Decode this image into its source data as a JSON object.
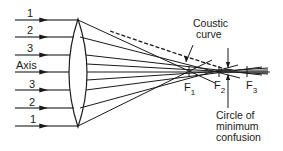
{
  "figure": {
    "colors": {
      "ink": "#1a1a1a",
      "background": "#ffffff"
    }
  },
  "rays": [
    {
      "label": "1",
      "y": 20
    },
    {
      "label": "2",
      "y": 37
    },
    {
      "label": "3",
      "y": 55
    },
    {
      "label": "Axis",
      "y": 71
    },
    {
      "label": "3",
      "y": 90
    },
    {
      "label": "2",
      "y": 108
    },
    {
      "label": "1",
      "y": 126
    }
  ],
  "foci": [
    {
      "label": "F",
      "sub": "1",
      "x": 189
    },
    {
      "label": "F",
      "sub": "2",
      "x": 219
    },
    {
      "label": "F",
      "sub": "3",
      "x": 247
    }
  ],
  "annotations": {
    "caustic_line1": "Coustic",
    "caustic_line2": "curve",
    "circle_line1": "Circle of",
    "circle_line2": "minimum",
    "circle_line3": "confusion"
  }
}
